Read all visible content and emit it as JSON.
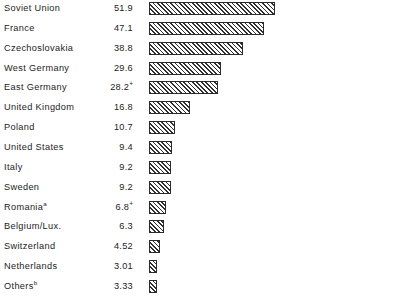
{
  "chart_data": {
    "type": "bar",
    "orientation": "horizontal",
    "title": "",
    "subtitle": "",
    "xlabel": "",
    "ylabel": "",
    "grid": false,
    "legend": null,
    "axis_visible": false,
    "tick_labels": [],
    "xlim": [
      0,
      51.9
    ],
    "value_column_shown": true,
    "categories": [
      "Soviet Union",
      "France",
      "Czechoslovakia",
      "West Germany",
      "East Germany",
      "United Kingdom",
      "Poland",
      "United States",
      "Italy",
      "Sweden",
      "Romania",
      "Belgium/Lux.",
      "Switzerland",
      "Netherlands",
      "Others"
    ],
    "values": [
      51.9,
      47.1,
      38.8,
      29.6,
      28.2,
      16.8,
      10.7,
      9.4,
      9.2,
      9.2,
      6.8,
      6.3,
      4.52,
      3.01,
      3.33
    ],
    "value_labels": [
      "51.9",
      "47.1",
      "38.8",
      "29.6",
      "28.2",
      "16.8",
      "10.7",
      "9.4",
      "9.2",
      "9.2",
      "6.8",
      "6.3",
      "4.52",
      "3.01",
      "3.33"
    ],
    "value_suffixes": [
      "",
      "",
      "",
      "",
      "+",
      "",
      "",
      "",
      "",
      "",
      "+",
      "",
      "",
      "",
      ""
    ],
    "category_footnotes": [
      "",
      "",
      "",
      "",
      "",
      "",
      "",
      "",
      "",
      "",
      "a",
      "",
      "",
      "",
      "b"
    ],
    "bar_style": {
      "fill": "diagonal-hatch",
      "hatch_direction": "forward-slash",
      "line_color": "#2f2f2f",
      "background_color": "#ffffff",
      "border_color": "#2b2b2b"
    }
  },
  "rows": [
    {
      "label": "Soviet Union",
      "footnote": "",
      "value": "51.9",
      "suffix": "",
      "num": 51.9
    },
    {
      "label": "France",
      "footnote": "",
      "value": "47.1",
      "suffix": "",
      "num": 47.1
    },
    {
      "label": "Czechoslovakia",
      "footnote": "",
      "value": "38.8",
      "suffix": "",
      "num": 38.8
    },
    {
      "label": "West Germany",
      "footnote": "",
      "value": "29.6",
      "suffix": "",
      "num": 29.6
    },
    {
      "label": "East Germany",
      "footnote": "",
      "value": "28.2",
      "suffix": "+",
      "num": 28.2
    },
    {
      "label": "United Kingdom",
      "footnote": "",
      "value": "16.8",
      "suffix": "",
      "num": 16.8
    },
    {
      "label": "Poland",
      "footnote": "",
      "value": "10.7",
      "suffix": "",
      "num": 10.7
    },
    {
      "label": "United States",
      "footnote": "",
      "value": "9.4",
      "suffix": "",
      "num": 9.4
    },
    {
      "label": "Italy",
      "footnote": "",
      "value": "9.2",
      "suffix": "",
      "num": 9.2
    },
    {
      "label": "Sweden",
      "footnote": "",
      "value": "9.2",
      "suffix": "",
      "num": 9.2
    },
    {
      "label": "Romania",
      "footnote": "a",
      "value": "6.8",
      "suffix": "+",
      "num": 6.8
    },
    {
      "label": "Belgium/Lux.",
      "footnote": "",
      "value": "6.3",
      "suffix": "",
      "num": 6.3
    },
    {
      "label": "Switzerland",
      "footnote": "",
      "value": "4.52",
      "suffix": "",
      "num": 4.52
    },
    {
      "label": "Netherlands",
      "footnote": "",
      "value": "3.01",
      "suffix": "",
      "num": 3.01
    },
    {
      "label": "Others",
      "footnote": "b",
      "value": "3.33",
      "suffix": "",
      "num": 3.33
    }
  ],
  "layout": {
    "row_pitch": 19.85,
    "first_row_top": -1,
    "bar_left": 149,
    "px_per_unit": 2.432,
    "min_bar_width": 8,
    "bar_height": 13
  }
}
